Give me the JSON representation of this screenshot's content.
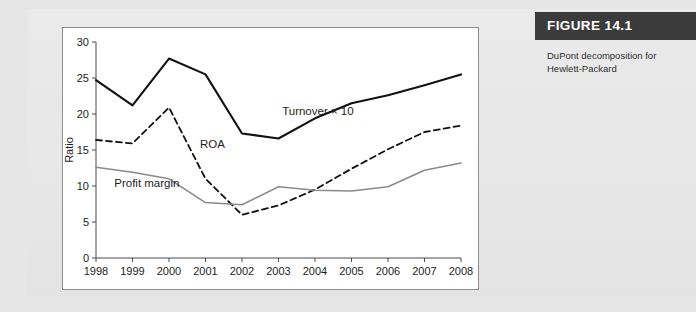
{
  "figure": {
    "banner_label": "FIGURE 14.1",
    "description": "DuPont decomposition for Hewlett-Packard",
    "banner_color": "#3b3b3b",
    "panel_color": "#ffffff",
    "page_color": "#e9e9e9"
  },
  "chart_data": {
    "type": "line",
    "title": "",
    "xlabel": "",
    "ylabel": "Ratio",
    "categories": [
      "1998",
      "1999",
      "2000",
      "2001",
      "2002",
      "2003",
      "2004",
      "2005",
      "2006",
      "2007",
      "2008"
    ],
    "x": [
      1998,
      1999,
      2000,
      2001,
      2002,
      2003,
      2004,
      2005,
      2006,
      2007,
      2008
    ],
    "xlim": [
      1998,
      2008
    ],
    "ylim": [
      0,
      30
    ],
    "yticks": [
      0,
      5,
      10,
      15,
      20,
      25,
      30
    ],
    "grid": false,
    "legend": "inline-annotations",
    "series": [
      {
        "name": "Turnover × 10",
        "color": "#111111",
        "style": "solid",
        "width": 2.1,
        "values": [
          24.7,
          21.2,
          27.7,
          25.5,
          17.3,
          16.6,
          19.4,
          21.5,
          22.6,
          24.0,
          25.5
        ]
      },
      {
        "name": "ROA",
        "color": "#111111",
        "style": "dashed",
        "width": 1.8,
        "values": [
          16.4,
          15.9,
          20.9,
          11.0,
          6.0,
          7.3,
          9.5,
          12.4,
          15.1,
          17.5,
          18.4
        ]
      },
      {
        "name": "Profit margin",
        "color": "#8a8a8a",
        "style": "solid",
        "width": 1.6,
        "values": [
          12.6,
          11.9,
          11.0,
          7.7,
          7.4,
          9.9,
          9.4,
          9.3,
          9.9,
          12.2,
          13.2
        ]
      }
    ],
    "annotations": [
      {
        "text": "Turnover × 10",
        "x": 2003.1,
        "y": 19.9
      },
      {
        "text": "ROA",
        "x": 2000.85,
        "y": 15.3
      },
      {
        "text": "Profit margin",
        "x": 1998.5,
        "y": 9.9
      }
    ]
  }
}
